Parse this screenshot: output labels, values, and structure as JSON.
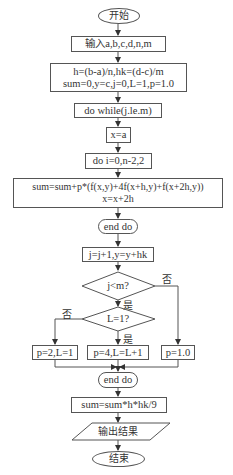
{
  "flowchart": {
    "start": "开始",
    "input": "输入a,b,c,d,n,m",
    "init_line1": "h=(b-a)/n,hk=(d-c)/m",
    "init_line2": "sum=0,y=c,j=0,L=1,p=1.0",
    "outer_loop": "do while(j.le.m)",
    "set_x": "x=a",
    "inner_loop": "do i=0,n-2,2",
    "sum_line1": "sum=sum+p*(f(x,y)+4f(x+h,y)+f(x+2h,y))",
    "sum_line2": "x=x+2h",
    "end_inner": "end do",
    "increment": "j=j+1,y=y+hk",
    "cond_j": "j<m?",
    "cond_L": "L=1?",
    "branch_no_L": "p=2,L=1",
    "branch_yes_L": "p=4,L=L+1",
    "branch_no_j": "p=1.0",
    "end_outer": "end do",
    "final_sum": "sum=sum*h*hk/9",
    "output": "输出结果",
    "end": "结束",
    "labels": {
      "yes": "是",
      "no": "否"
    }
  },
  "colors": {
    "stroke": "#555555",
    "text": "#333333",
    "background": "#ffffff"
  }
}
